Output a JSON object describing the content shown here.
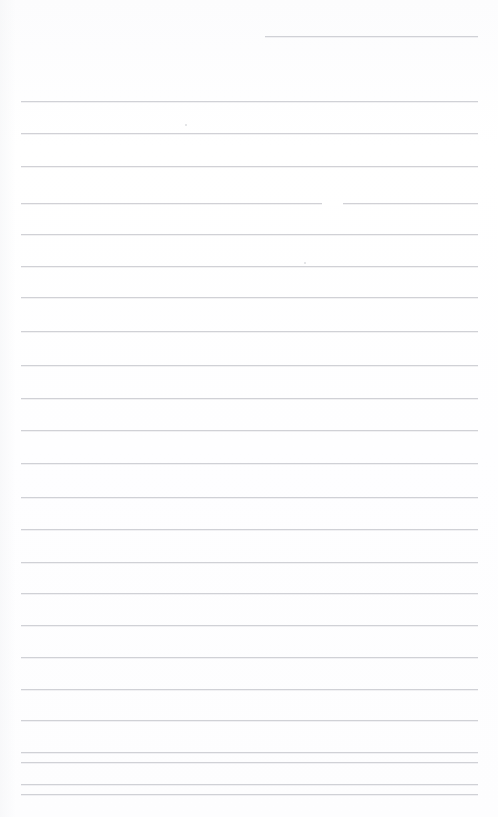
{
  "document": {
    "kind": "scanned-ruled-paper",
    "title": "Scanned Ruled Page",
    "page_width": 498,
    "page_height": 817,
    "background_color": "#ffffff",
    "rule_color": "#c9cbd0",
    "rule_thickness": 1,
    "body_text": "",
    "visible_text": "",
    "notes": "Blank lined notebook page; no handwriting or printed text is visible."
  },
  "ruling": {
    "line_count": 25,
    "left_margin_x": 21,
    "right_margin_x": 478,
    "first_full_line_y": 101,
    "line_spacing": 31.7,
    "lines": [
      {
        "index": 0,
        "y": 36,
        "x1": 265,
        "x2": 478,
        "partial": true
      },
      {
        "index": 1,
        "y": 101,
        "x1": 21,
        "x2": 478,
        "partial": false
      },
      {
        "index": 2,
        "y": 133,
        "x1": 21,
        "x2": 478,
        "partial": false
      },
      {
        "index": 3,
        "y": 166,
        "x1": 21,
        "x2": 478,
        "partial": false
      },
      {
        "index": 4,
        "y": 203,
        "x1": 21,
        "x2": 478,
        "partial": false
      },
      {
        "index": 5,
        "y": 234,
        "x1": 21,
        "x2": 478,
        "partial": false
      },
      {
        "index": 6,
        "y": 266,
        "x1": 21,
        "x2": 478,
        "partial": false
      },
      {
        "index": 7,
        "y": 297,
        "x1": 21,
        "x2": 478,
        "partial": false
      },
      {
        "index": 8,
        "y": 331,
        "x1": 21,
        "x2": 478,
        "partial": false
      },
      {
        "index": 9,
        "y": 365,
        "x1": 21,
        "x2": 478,
        "partial": false
      },
      {
        "index": 10,
        "y": 398,
        "x1": 21,
        "x2": 478,
        "partial": false
      },
      {
        "index": 11,
        "y": 430,
        "x1": 21,
        "x2": 478,
        "partial": false
      },
      {
        "index": 12,
        "y": 463,
        "x1": 21,
        "x2": 478,
        "partial": false
      },
      {
        "index": 13,
        "y": 497,
        "x1": 21,
        "x2": 478,
        "partial": false
      },
      {
        "index": 14,
        "y": 529,
        "x1": 21,
        "x2": 478,
        "partial": false
      },
      {
        "index": 15,
        "y": 562,
        "x1": 21,
        "x2": 478,
        "partial": false
      },
      {
        "index": 16,
        "y": 593,
        "x1": 21,
        "x2": 478,
        "partial": false
      },
      {
        "index": 17,
        "y": 625,
        "x1": 21,
        "x2": 478,
        "partial": false
      },
      {
        "index": 18,
        "y": 657,
        "x1": 21,
        "x2": 478,
        "partial": false
      },
      {
        "index": 19,
        "y": 689,
        "x1": 21,
        "x2": 478,
        "partial": false
      },
      {
        "index": 20,
        "y": 720,
        "x1": 21,
        "x2": 478,
        "partial": false
      },
      {
        "index": 21,
        "y": 752,
        "x1": 21,
        "x2": 478,
        "partial": false
      },
      {
        "index": 22,
        "y": 762,
        "x1": 21,
        "x2": 478,
        "partial": false
      },
      {
        "index": 23,
        "y": 784,
        "x1": 21,
        "x2": 478,
        "partial": false
      },
      {
        "index": 24,
        "y": 794,
        "x1": 21,
        "x2": 478,
        "partial": false
      }
    ]
  },
  "artifacts": {
    "gaps": [
      {
        "on_line_index": 4,
        "y": 202,
        "x1": 322,
        "x2": 343
      }
    ],
    "specks": [
      {
        "x": 185,
        "y": 124
      },
      {
        "x": 304,
        "y": 262
      }
    ]
  }
}
